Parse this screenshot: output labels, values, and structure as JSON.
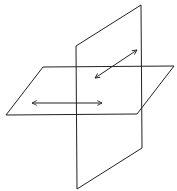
{
  "diagram": {
    "stroke_color": "#222222",
    "background": "#ffffff",
    "vertical_plane": {
      "points": "141,5 76,46 77,189 142,148"
    },
    "horizontal_plane": {
      "points": "43,67 174,66 137,114 6,115"
    },
    "arrows": [
      {
        "name": "diagonal-double-arrow",
        "x1": 95,
        "y1": 78,
        "x2": 137,
        "y2": 50
      },
      {
        "name": "horizontal-double-arrow",
        "x1": 32,
        "y1": 103,
        "x2": 102,
        "y2": 103
      }
    ]
  }
}
